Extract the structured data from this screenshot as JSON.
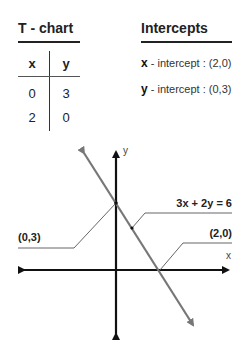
{
  "tchart": {
    "title": "T - chart",
    "headers": [
      "x",
      "y"
    ],
    "rows": [
      [
        "0",
        "3"
      ],
      [
        "2",
        "0"
      ]
    ]
  },
  "intercepts": {
    "title": "Intercepts",
    "items": [
      {
        "var": "x",
        "text": " - intercept : (2,0)"
      },
      {
        "var": "y",
        "text": " - intercept : (0,3)"
      }
    ]
  },
  "graph": {
    "equation": "3x + 2y = 6",
    "y_intercept_label": "(0,3)",
    "x_intercept_label": "(2,0)",
    "x_axis_label": "x",
    "y_axis_label": "y",
    "colors": {
      "axes": "#111111",
      "line": "#777777",
      "leader": "#555555"
    }
  }
}
